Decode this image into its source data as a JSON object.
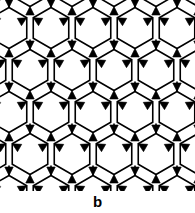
{
  "figure": {
    "label": "b",
    "caption_position": "bottom-center",
    "width_px": 195,
    "height_px": 213,
    "background_color": "#ffffff",
    "ink_color": "#000000"
  },
  "pattern": {
    "name": "hexagonal-net-with-filled-triangles",
    "description": "Tiling of irregular hexagonal rings joined at three-way nodes marked by solid black triangular wedges",
    "panel": {
      "x": 0,
      "y": 0,
      "width": 195,
      "height": 191
    },
    "lattice": {
      "period_x": 42,
      "period_y": 42,
      "row_offset_x": 21,
      "origin_x": -12,
      "origin_y": -14,
      "columns": 6,
      "rows": 6
    },
    "hexagon": {
      "radius_x": 20.5,
      "radius_y": 20.5,
      "stroke_width": 1.6,
      "fill": "#ffffff",
      "stroke": "#000000",
      "vertex_angles_deg": [
        90,
        150,
        210,
        270,
        330,
        30
      ]
    },
    "node_triangle": {
      "fill": "#000000",
      "size": 9.5,
      "count_per_cell": 2,
      "orientations_deg": [
        0,
        180
      ]
    },
    "linker": {
      "stroke": "#000000",
      "stroke_width": 1.6,
      "length": 10
    }
  },
  "chart_data": {
    "type": "diagram",
    "title": "b",
    "geometry": "2D periodic hexagonal net",
    "unit_cell_nm": null
  }
}
